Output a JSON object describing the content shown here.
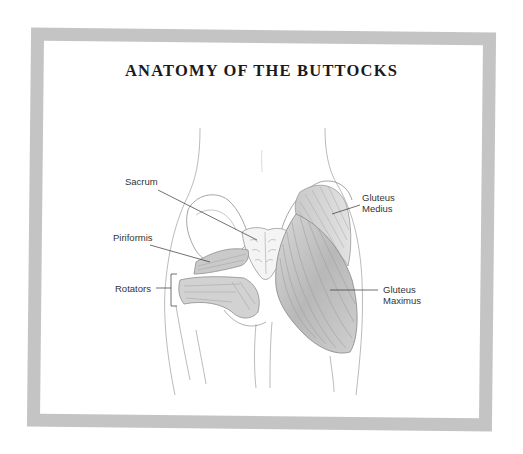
{
  "title": "ANATOMY OF THE BUTTOCKS",
  "colors": {
    "frame": "#c4c4c4",
    "background": "#ffffff",
    "title": "#1a1a1a",
    "label": "#333333",
    "leader_line": "#333333",
    "sketch": "#9a9a9a"
  },
  "labels": {
    "sacrum": "Sacrum",
    "piriformis": "Piriformis",
    "rotators": "Rotators",
    "gluteus_medius_line1": "Gluteus",
    "gluteus_medius_line2": "Medius",
    "gluteus_maximus_line1": "Gluteus",
    "gluteus_maximus_line2": "Maximus"
  }
}
